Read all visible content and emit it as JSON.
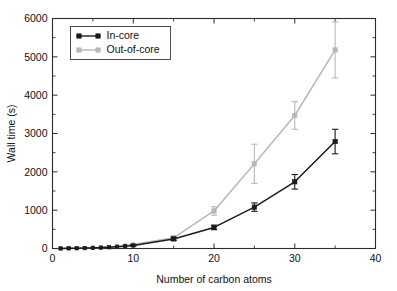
{
  "chart_data": {
    "type": "line",
    "title": "",
    "xlabel": "Number of carbon atoms",
    "ylabel": "Wall time (s)",
    "xlim": [
      0,
      40
    ],
    "ylim": [
      0,
      6000
    ],
    "xticks": [
      0,
      10,
      20,
      30,
      40
    ],
    "yticks": [
      0,
      1000,
      2000,
      3000,
      4000,
      5000,
      6000
    ],
    "xtick_labels": [
      "0",
      "10",
      "20",
      "30",
      "40"
    ],
    "ytick_labels": [
      "0",
      "1000",
      "2000",
      "3000",
      "4000",
      "5000",
      "6000"
    ],
    "x_minor_interval": 5,
    "y_minor_interval": 500,
    "grid": false,
    "legend_position": "upper-left-inside",
    "errorbars": true,
    "series": [
      {
        "name": "In-core",
        "color": "#1a1a1a",
        "marker": "filled-square",
        "x": [
          1,
          2,
          3,
          4,
          5,
          6,
          7,
          8,
          9,
          10,
          15,
          20,
          25,
          30,
          35
        ],
        "values": [
          2,
          4,
          7,
          11,
          16,
          23,
          32,
          44,
          60,
          80,
          250,
          550,
          1080,
          1740,
          2790
        ],
        "yerr": [
          0,
          0,
          0,
          0,
          0,
          0,
          0,
          0,
          0,
          20,
          40,
          60,
          110,
          190,
          320
        ]
      },
      {
        "name": "Out-of-core",
        "color": "#b8b8b8",
        "marker": "filled-square",
        "x": [
          1,
          2,
          3,
          4,
          5,
          6,
          7,
          8,
          9,
          10,
          15,
          20,
          25,
          30,
          35
        ],
        "values": [
          2,
          5,
          9,
          14,
          20,
          29,
          41,
          57,
          78,
          105,
          280,
          980,
          2210,
          3470,
          5180
        ],
        "yerr": [
          0,
          0,
          0,
          0,
          0,
          0,
          0,
          0,
          0,
          25,
          40,
          110,
          510,
          360,
          730
        ]
      }
    ]
  },
  "legend": {
    "entries": [
      {
        "label": "In-core",
        "color": "#1a1a1a"
      },
      {
        "label": "Out-of-core",
        "color": "#b8b8b8"
      }
    ]
  },
  "colors": {
    "axis": "#2b2b2b",
    "in_core": "#1a1a1a",
    "out_of_core": "#b8b8b8",
    "background": "#ffffff"
  }
}
